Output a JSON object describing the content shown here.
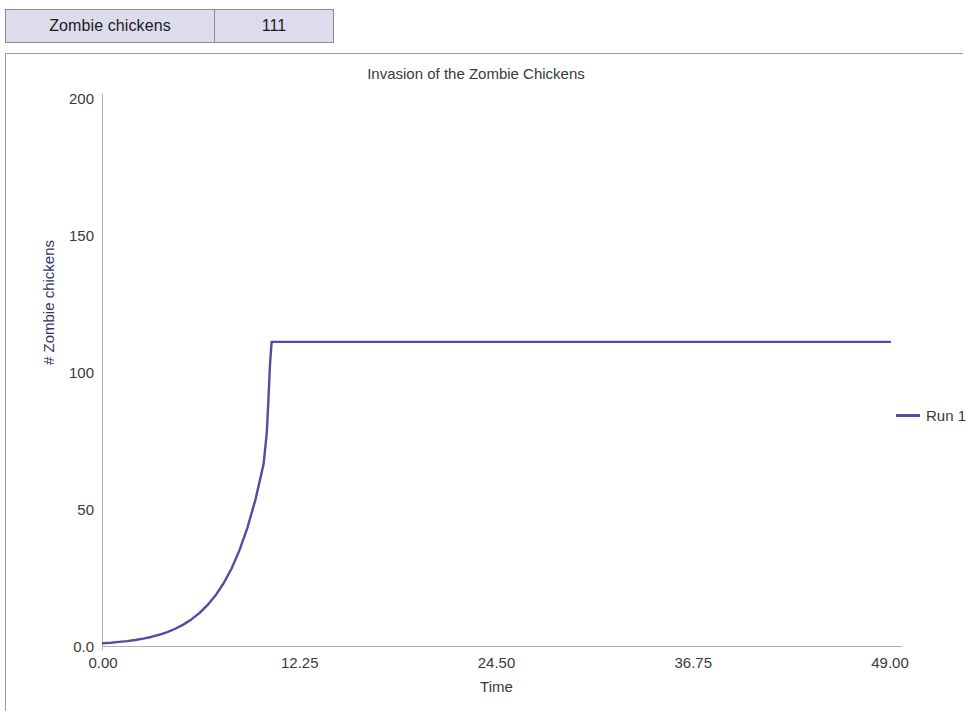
{
  "readout": {
    "label": "Zombie chickens",
    "value": "111"
  },
  "chart_data": {
    "type": "line",
    "title": "Invasion of the Zombie Chickens",
    "xlabel": "Time",
    "ylabel": "# Zombie chickens",
    "xlim": [
      0,
      49
    ],
    "ylim": [
      0,
      200
    ],
    "xticks": [
      "0.00",
      "12.25",
      "24.50",
      "36.75",
      "49.00"
    ],
    "xtick_values": [
      0,
      12.25,
      24.5,
      36.75,
      49
    ],
    "yticks": [
      "0.0",
      "50",
      "100",
      "150",
      "200"
    ],
    "ytick_values": [
      0,
      50,
      100,
      150,
      200
    ],
    "grid": false,
    "legend_position": "right",
    "series": [
      {
        "name": "Run 1",
        "color": "#4f4f9e",
        "x": [
          0,
          0.5,
          1,
          1.5,
          2,
          2.5,
          3,
          3.5,
          4,
          4.5,
          5,
          5.5,
          6,
          6.5,
          7,
          7.5,
          8,
          8.5,
          9,
          9.5,
          10,
          10.2,
          10.3,
          10.4,
          10.5,
          12.25,
          16,
          20,
          24.5,
          30,
          36.75,
          42,
          49
        ],
        "y": [
          1,
          1.2,
          1.5,
          1.8,
          2.2,
          2.7,
          3.3,
          4.1,
          5.1,
          6.3,
          7.8,
          9.7,
          12,
          14.9,
          18.4,
          22.8,
          28.2,
          35,
          43.3,
          53.6,
          66.4,
          78,
          90,
          103,
          111,
          111,
          111,
          111,
          111,
          111,
          111,
          111,
          111
        ]
      }
    ]
  },
  "legend": {
    "entries": [
      {
        "label": "Run 1",
        "color": "#4f4f9e"
      }
    ]
  }
}
